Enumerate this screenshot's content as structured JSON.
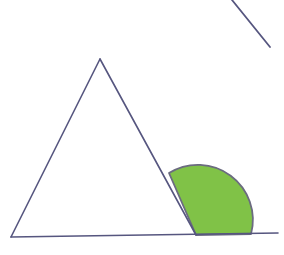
{
  "figure": {
    "canvas": {
      "width": 284,
      "height": 255,
      "background_color": "#ffffff"
    },
    "colors": {
      "line_color": "#56567f",
      "sector_fill_color": "#80c247",
      "sector_outline_color": "#6b6b80",
      "background_color": "#ffffff"
    },
    "stroke_width": 1.6,
    "shapes": {
      "triangle": {
        "name": "triangle",
        "vertices": [
          {
            "label": "apex",
            "x": 100,
            "y": 59
          },
          {
            "label": "bottom-left",
            "x": 11,
            "y": 237
          },
          {
            "label": "bottom-right",
            "x": 196,
            "y": 235
          }
        ]
      },
      "baseline": {
        "name": "baseline-extension",
        "start": {
          "x": 11,
          "y": 237
        },
        "end": {
          "x": 278,
          "y": 233
        }
      },
      "angle_sector": {
        "name": "angle-sector",
        "vertex": {
          "x": 196,
          "y": 235
        },
        "radius": 55,
        "start_point": {
          "x": 251,
          "y": 234
        },
        "end_point": {
          "x": 169,
          "y": 173
        },
        "sweep_description": "from baseline rightward up to the triangle right side"
      },
      "diagonal_segment": {
        "name": "diagonal-segment",
        "start": {
          "x": 232,
          "y": 0
        },
        "end": {
          "x": 270,
          "y": 47
        }
      }
    }
  }
}
